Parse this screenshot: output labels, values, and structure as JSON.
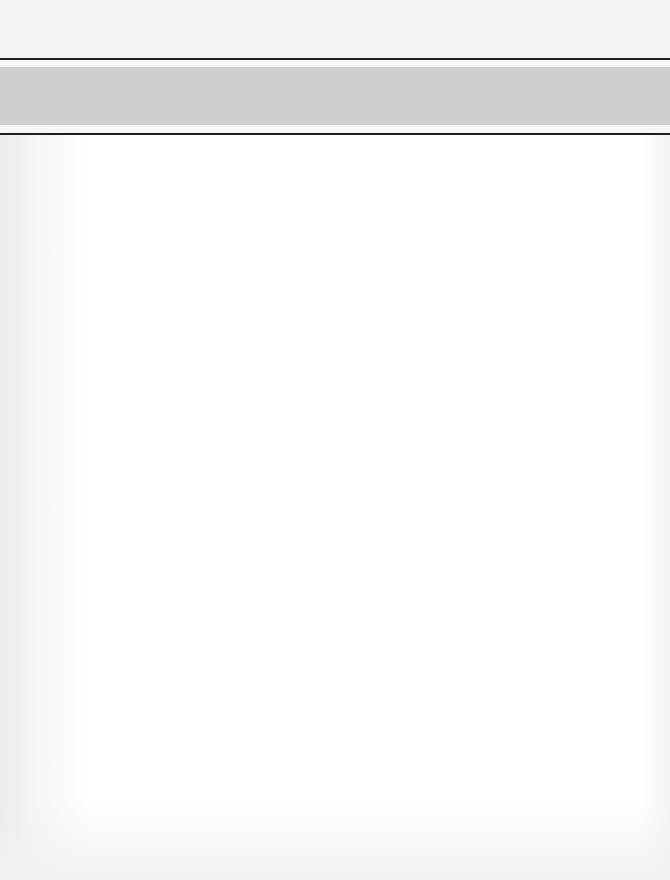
{
  "document": {
    "title": "",
    "body_text": ""
  },
  "colors": {
    "page_background": "#ffffff",
    "header_band": "#cfcfcf",
    "rule": "#1e1e1e"
  }
}
